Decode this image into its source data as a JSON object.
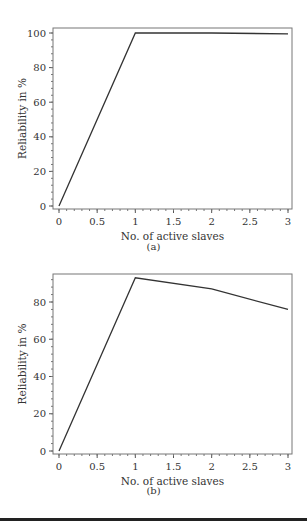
{
  "chart_data": [
    {
      "type": "line",
      "panel": "(a)",
      "title": "",
      "xlabel": "No. of active slaves",
      "ylabel": "Reliability in %",
      "x": [
        0,
        1,
        2,
        3
      ],
      "series": [
        {
          "name": "Reliability",
          "values": [
            0,
            100,
            100,
            99.5
          ]
        }
      ],
      "xlim": [
        0,
        3
      ],
      "ylim": [
        0,
        102
      ],
      "xticks": [
        "0",
        "0.5",
        "1",
        "1.5",
        "2",
        "2.5",
        "3"
      ],
      "yticks": [
        "0",
        "20",
        "40",
        "60",
        "80",
        "100"
      ],
      "grid": false,
      "legend": "none",
      "caption": "(a)"
    },
    {
      "type": "line",
      "panel": "(b)",
      "title": "",
      "xlabel": "No. of active slaves",
      "ylabel": "Reliability in %",
      "x": [
        0,
        1,
        2,
        3
      ],
      "series": [
        {
          "name": "Reliability",
          "values": [
            0,
            93,
            87,
            76
          ]
        }
      ],
      "xlim": [
        0,
        3
      ],
      "ylim": [
        0,
        95
      ],
      "xticks": [
        "0",
        "0.5",
        "1",
        "1.5",
        "2",
        "2.5",
        "3"
      ],
      "yticks": [
        "0",
        "20",
        "40",
        "60",
        "80"
      ],
      "grid": false,
      "legend": "none",
      "caption": "(b)"
    }
  ]
}
